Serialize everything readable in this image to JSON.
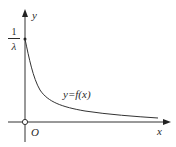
{
  "figure": {
    "type": "function-graph",
    "axes": {
      "x_label": "x",
      "y_label": "y",
      "origin_label": "O"
    },
    "y_intercept": {
      "numerator": "1",
      "denominator": "λ"
    },
    "curve": {
      "label": "y=f(x)",
      "description": "decreasing curve starting at (0, 1/λ), approaching x-axis asymptotically"
    },
    "colors": {
      "stroke": "#333333",
      "text": "#2a2a2a",
      "background": "#ffffff"
    }
  }
}
